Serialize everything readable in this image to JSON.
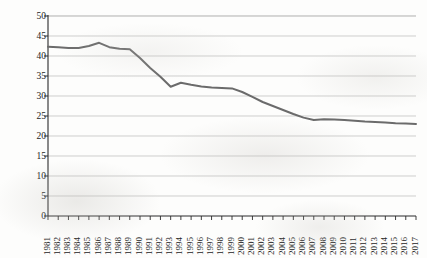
{
  "chart_data": {
    "type": "line",
    "title": "",
    "xlabel": "",
    "ylabel": "Average corproate tax rate",
    "ylim": [
      0,
      50
    ],
    "yticks": [
      0,
      5,
      10,
      15,
      20,
      25,
      30,
      35,
      40,
      45,
      50
    ],
    "grid": true,
    "legend": "none",
    "line_color": "#6b6b6b",
    "axis_color": "#2a2a2a",
    "grid_color": "#b9b9b9",
    "categories": [
      "1981",
      "1982",
      "1983",
      "1984",
      "1985",
      "1986",
      "1987",
      "1988",
      "1989",
      "1990",
      "1991",
      "1992",
      "1993",
      "1994",
      "1995",
      "1996",
      "1997",
      "1998",
      "1999",
      "2000",
      "2001",
      "2002",
      "2003",
      "2004",
      "2005",
      "2006",
      "2007",
      "2008",
      "2009",
      "2010",
      "2011",
      "2012",
      "2013",
      "2014",
      "2015",
      "2016",
      "2017"
    ],
    "values": [
      42.3,
      42.2,
      42.0,
      42.0,
      42.5,
      43.3,
      42.2,
      41.8,
      41.7,
      39.5,
      37.0,
      34.8,
      32.3,
      33.3,
      32.8,
      32.4,
      32.1,
      32.0,
      31.9,
      31.0,
      29.8,
      28.5,
      27.5,
      26.5,
      25.5,
      24.6,
      24.0,
      24.2,
      24.1,
      24.0,
      23.8,
      23.6,
      23.5,
      23.4,
      23.2,
      23.1,
      23.0
    ],
    "series": [
      {
        "name": "Average corproate tax rate",
        "values": [
          42.3,
          42.2,
          42.0,
          42.0,
          42.5,
          43.3,
          42.2,
          41.8,
          41.7,
          39.5,
          37.0,
          34.8,
          32.3,
          33.3,
          32.8,
          32.4,
          32.1,
          32.0,
          31.9,
          31.0,
          29.8,
          28.5,
          27.5,
          26.5,
          25.5,
          24.6,
          24.0,
          24.2,
          24.1,
          24.0,
          23.8,
          23.6,
          23.5,
          23.4,
          23.2,
          23.1,
          23.0
        ]
      }
    ]
  }
}
